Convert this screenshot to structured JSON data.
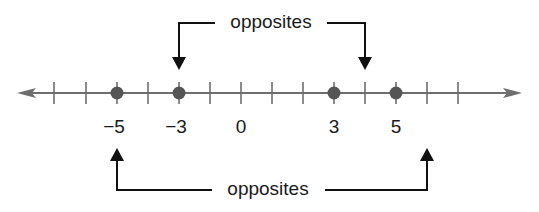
{
  "diagram": {
    "type": "number-line",
    "top_label": "opposites",
    "bottom_label": "opposites",
    "ticks": [
      -6,
      -5,
      -4,
      -3,
      -2,
      -1,
      0,
      1,
      2,
      3,
      4,
      5,
      6,
      7
    ],
    "tick_labels": [
      {
        "value": -5,
        "text": "−5"
      },
      {
        "value": -3,
        "text": "−3"
      },
      {
        "value": 0,
        "text": "0"
      },
      {
        "value": 3,
        "text": "3"
      },
      {
        "value": 5,
        "text": "5"
      }
    ],
    "points": [
      -5,
      -3,
      3,
      5
    ],
    "pairs": [
      {
        "label": "opposites",
        "values": [
          -3,
          3
        ],
        "position": "top"
      },
      {
        "label": "opposites",
        "values": [
          -5,
          5
        ],
        "position": "bottom"
      }
    ],
    "colors": {
      "line": "#6e6e6e",
      "point": "#555555",
      "arrow": "#111111"
    }
  }
}
